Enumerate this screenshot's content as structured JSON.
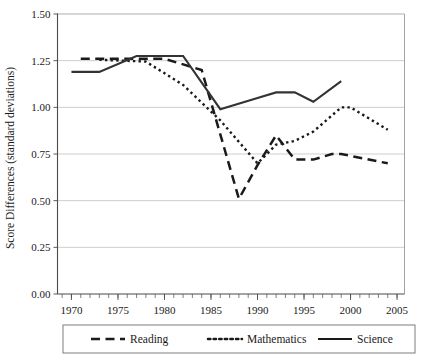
{
  "chart_data": {
    "type": "line",
    "title": "",
    "xlabel": "",
    "ylabel": "Score Differences (standard deviations)",
    "xlim": [
      1968.5,
      2005.8
    ],
    "ylim": [
      0.0,
      1.5
    ],
    "grid": true,
    "legend_position": "bottom",
    "ytick_labels": [
      "0.00",
      "0.25",
      "0.50",
      "0.75",
      "1.00",
      "1.25",
      "1.50"
    ],
    "ytick_values": [
      0.0,
      0.25,
      0.5,
      0.75,
      1.0,
      1.25,
      1.5
    ],
    "xtick_labels": [
      "1970",
      "1975",
      "1980",
      "1985",
      "1990",
      "1995",
      "2000",
      "2005"
    ],
    "xtick_values": [
      1970,
      1975,
      1980,
      1985,
      1990,
      1995,
      2000,
      2005
    ],
    "x_minor_step": 1,
    "series": [
      {
        "name": "Reading",
        "style": "dashed",
        "color": "#1a1a1a",
        "points": [
          [
            1971,
            1.26
          ],
          [
            1975,
            1.26
          ],
          [
            1980,
            1.26
          ],
          [
            1984,
            1.2
          ],
          [
            1988,
            0.51
          ],
          [
            1990,
            0.69
          ],
          [
            1992,
            0.85
          ],
          [
            1994,
            0.72
          ],
          [
            1996,
            0.72
          ],
          [
            1998,
            0.75
          ],
          [
            1999,
            0.75
          ],
          [
            2004,
            0.7
          ]
        ]
      },
      {
        "name": "Mathematics",
        "style": "dotted",
        "color": "#1a1a1a",
        "points": [
          [
            1973,
            1.255
          ],
          [
            1978,
            1.245
          ],
          [
            1982,
            1.12
          ],
          [
            1986,
            0.93
          ],
          [
            1990,
            0.7
          ],
          [
            1992,
            0.8
          ],
          [
            1994,
            0.82
          ],
          [
            1996,
            0.87
          ],
          [
            1999,
            1.0
          ],
          [
            2000,
            1.0
          ],
          [
            2004,
            0.88
          ]
        ]
      },
      {
        "name": "Science",
        "style": "solid",
        "color": "#333333",
        "points": [
          [
            1970,
            1.19
          ],
          [
            1973,
            1.19
          ],
          [
            1977,
            1.275
          ],
          [
            1982,
            1.275
          ],
          [
            1986,
            0.99
          ],
          [
            1990,
            1.05
          ],
          [
            1992,
            1.08
          ],
          [
            1994,
            1.08
          ],
          [
            1996,
            1.03
          ],
          [
            1999,
            1.14
          ]
        ]
      }
    ]
  },
  "legend": {
    "items": [
      {
        "label": "Reading",
        "style": "dashed"
      },
      {
        "label": "Mathematics",
        "style": "dotted"
      },
      {
        "label": "Science",
        "style": "solid"
      }
    ]
  }
}
